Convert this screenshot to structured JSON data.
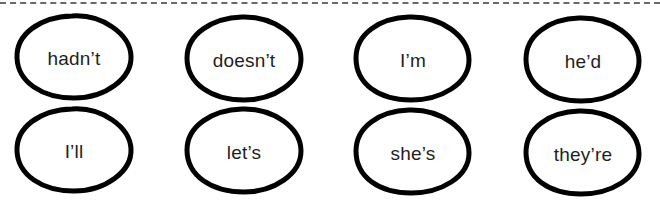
{
  "worksheet": {
    "cut_line": "dashed",
    "contractions": [
      {
        "word": "hadn’t"
      },
      {
        "word": "doesn’t"
      },
      {
        "word": "I’m"
      },
      {
        "word": "he’d"
      },
      {
        "word": "I’ll"
      },
      {
        "word": "let’s"
      },
      {
        "word": "she’s"
      },
      {
        "word": "they’re"
      }
    ],
    "colors": {
      "outline": "#000000",
      "text": "#1e1e1e",
      "dashed_line": "#6a6a6a",
      "background": "#ffffff"
    }
  }
}
